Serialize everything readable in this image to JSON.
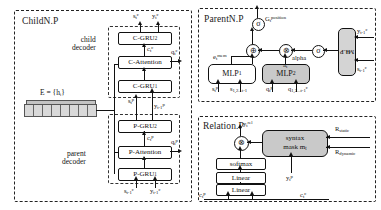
{
  "figure": {
    "panels": {
      "child": {
        "title": "ChildN.P"
      },
      "parent": {
        "title": "ParentN.P"
      },
      "relation": {
        "title": "Relation.P"
      }
    }
  },
  "child_panel": {
    "title": "ChildN.P",
    "child_decoder_label_line1": "child",
    "child_decoder_label_line2": "decoder",
    "parent_decoder_label_line1": "parent",
    "parent_decoder_label_line2": "decoder",
    "encoder_label": "E = {hᵢ}",
    "boxes": {
      "c_gru2": "C-GRU",
      "c_gru2_sub": "2",
      "c_attention": "C-Attention",
      "c_gru1": "C-GRU",
      "c_gru1_sub": "1",
      "p_gru2": "P-GRU",
      "p_gru2_sub": "2",
      "p_attention": "P-Attention",
      "p_gru1": "P-GRU",
      "p_gru1_sub": "1"
    },
    "signals": {
      "s_t_c": "s",
      "s_t_c_sub": "t",
      "s_t_c_sup": "c",
      "y_t_c": "y",
      "y_t_c_sub": "t",
      "y_t_c_sup": "c",
      "c_t_c": "c",
      "c_t_c_sub": "t",
      "c_t_c_sup": "c",
      "q_t_c": "q",
      "q_t_c_sub": "t",
      "q_t_c_sup": "c",
      "s_t_p": "s",
      "s_t_p_sub": "t",
      "s_t_p_sup": "p",
      "y_tm1_p": "y",
      "y_tm1_p_sub": "t-1",
      "y_tm1_p_sup": "p",
      "c_t_p": "c",
      "c_t_p_sub": "t",
      "c_t_p_sup": "p",
      "q_t_p": "q",
      "q_t_p_sub": "t",
      "q_t_p_sup": "p",
      "s_tm1_c": "s",
      "s_tm1_c_sub": "t-1",
      "s_tm1_c_sup": "c",
      "y_tm1_c": "y",
      "y_tm1_c_sub": "t-1",
      "y_tm1_c_sup": "c"
    }
  },
  "parent_panel": {
    "title": "ParentN.P",
    "boxes": {
      "mlp1": "MLP",
      "mlp1_sub": "1",
      "mlp2": "MLP",
      "mlp2_sub": "2",
      "mlp3": "MLP",
      "mlp3_sub": "3"
    },
    "operators": {
      "sigma_top": "σ",
      "sigma_right": "σ",
      "plus": "⊕",
      "times": "⊗"
    },
    "signals": {
      "G_position": "G",
      "G_position_sub": "t",
      "G_position_sup": "position",
      "e_mem": "e",
      "e_mem_sub": "t",
      "e_mem_sup": "mem",
      "e_alpha": "e",
      "e_alpha_sub": "t",
      "e_alpha_sup": "alpha",
      "alpha_label": "alpha",
      "a_t": "a",
      "a_t_sub": "t",
      "s_t_p": "s",
      "s_t_p_sub": "t",
      "s_t_p_sup": "p",
      "s_hist": "s",
      "s_hist_sub": "1,2...t-1",
      "q_t_p": "q",
      "q_t_p_sub": "t",
      "q_t_p_sup": "p",
      "q_hist": "q",
      "q_hist_sub": "1,2...t-1",
      "q_hist_sup": "c",
      "y_tm1_c": "y",
      "y_tm1_c_sub": "t-1",
      "y_tm1_c_sup": "c",
      "s_tm1_c": "s",
      "s_tm1_c_sub": "t-1",
      "s_tm1_c_sup": "c"
    }
  },
  "relation_panel": {
    "title": "Relation.P",
    "boxes": {
      "softmax": "softmax",
      "linear_upper": "Linear",
      "linear_lower": "Linear",
      "syntax_mask_line1": "syntax",
      "syntax_mask_line2": "mask m",
      "syntax_mask_sub": "t"
    },
    "operators": {
      "times": "⊗"
    },
    "signals": {
      "y_rel": "y",
      "y_rel_sub": "t",
      "y_rel_sup": "rel",
      "R_static": "R",
      "R_static_sub": "static",
      "R_dynamic": "R",
      "R_dynamic_sub": "dynamic",
      "y_t_p": "y",
      "y_t_p_sub": "t",
      "y_t_p_sup": "p",
      "c_t_p": "c",
      "c_t_p_sub": "t",
      "c_t_p_sup": "p",
      "c_t_c": "c",
      "c_t_c_sub": "t",
      "c_t_c_sup": "c"
    }
  },
  "colors": {
    "line": "#111111",
    "grey_fill": "#c9c9c9",
    "panel_border": "#222222"
  }
}
